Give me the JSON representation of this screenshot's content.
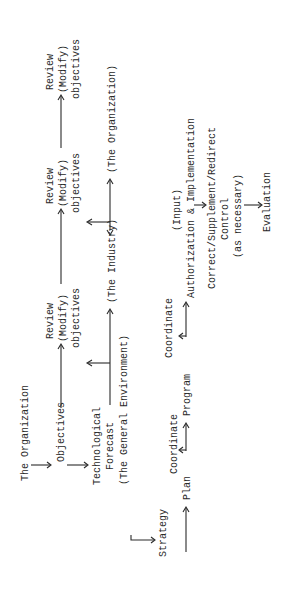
{
  "diagram": {
    "orientation": "rotated-90-ccw",
    "nodes": {
      "organization": "The Organization",
      "objectives": "Objectives",
      "tech_forecast_1": "Technological",
      "tech_forecast_2": "Forecast",
      "tech_forecast_3": "(The General Environment)",
      "strategy": "Strategy",
      "plan": "Plan",
      "coordinate_1": "Coordinate",
      "program": "Program",
      "coordinate_2": "Coordinate",
      "input": "(Input)",
      "authorization": "Authorization & Implementation",
      "correct": "Correct/Supplement/Redirect",
      "control": "Control",
      "as_necessary": "(as necessary)",
      "evaluation": "Evaluation",
      "review1": {
        "l1": "Review",
        "l2": "(Modify)",
        "l3": "objectives"
      },
      "review2": {
        "l1": "Review",
        "l2": "(Modify)",
        "l3": "objectives"
      },
      "review3": {
        "l1": "Review",
        "l2": "(Modify)",
        "l3": "objectives"
      },
      "industry": "(The Industry)",
      "organization2": "(The Organization)"
    },
    "colors": {
      "ink": "#2a2a2a",
      "background": "#ffffff"
    }
  }
}
